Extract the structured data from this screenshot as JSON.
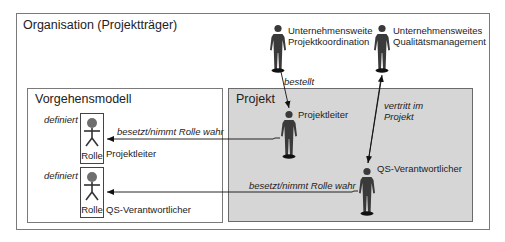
{
  "diagram": {
    "organisation": {
      "title": "Organisation (Projektträger)"
    },
    "vorgehensmodell": {
      "title": "Vorgehensmodell",
      "roles": [
        {
          "defines_label": "definiert",
          "role_label": "Rolle",
          "name": "Projektleiter"
        },
        {
          "defines_label": "definiert",
          "role_label": "Rolle",
          "name": "QS-Verantwortlicher"
        }
      ]
    },
    "projekt": {
      "title": "Projekt",
      "actors": [
        {
          "name": "Projektleiter"
        },
        {
          "name": "QS-Verantwortlicher"
        }
      ]
    },
    "org_actors": [
      {
        "name_line1": "Unternehmensweite",
        "name_line2": "Projektkoordination"
      },
      {
        "name_line1": "Unternehmensweites",
        "name_line2": "Qualitätsmanagement"
      }
    ],
    "relations": {
      "bestellt": "bestellt",
      "vertritt_line1": "vertritt im",
      "vertritt_line2": "Projekt",
      "besetzt_pl": "besetzt/nimmt Rolle wahr",
      "besetzt_qs": "besetzt/nimmt Rolle wahr"
    },
    "colors": {
      "project_fill": "#d6d6d6",
      "figure": "#3a3a3a",
      "role_figure": "#6e6e6e",
      "border": "#7a7a7a"
    }
  }
}
